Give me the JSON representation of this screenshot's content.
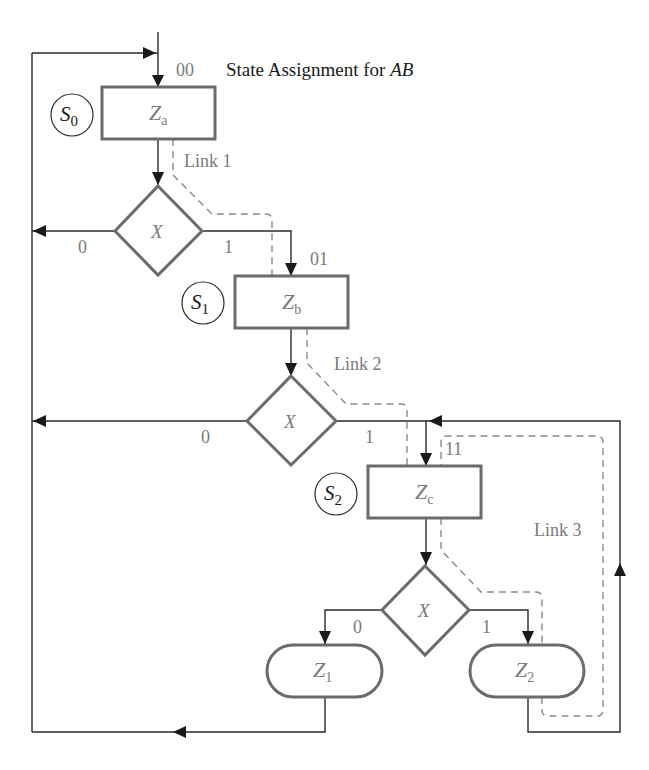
{
  "title": {
    "prefix": "State Assignment for ",
    "vars": "AB"
  },
  "states": [
    {
      "id": "S0",
      "letter": "S",
      "index": "0",
      "box_main": "Z",
      "box_sub": "a",
      "code": "00"
    },
    {
      "id": "S1",
      "letter": "S",
      "index": "1",
      "box_main": "Z",
      "box_sub": "b",
      "code": "01"
    },
    {
      "id": "S2",
      "letter": "S",
      "index": "2",
      "box_main": "Z",
      "box_sub": "c",
      "code": "11"
    }
  ],
  "decisions": [
    {
      "var": "X",
      "false_label": "0",
      "true_label": "1"
    },
    {
      "var": "X",
      "false_label": "0",
      "true_label": "1"
    },
    {
      "var": "X",
      "false_label": "0",
      "true_label": "1"
    }
  ],
  "outputs": [
    {
      "main": "Z",
      "sub": "1"
    },
    {
      "main": "Z",
      "sub": "2"
    }
  ],
  "links": [
    {
      "label": "Link 1"
    },
    {
      "label": "Link 2"
    },
    {
      "label": "Link 3"
    }
  ],
  "colors": {
    "shape_stroke": "#6b6b6b",
    "flow_line": "#2a2a2a",
    "link_dashed": "#8a8a8a",
    "gray_text": "#7a7a7a",
    "black_text": "#1a1a1a"
  }
}
